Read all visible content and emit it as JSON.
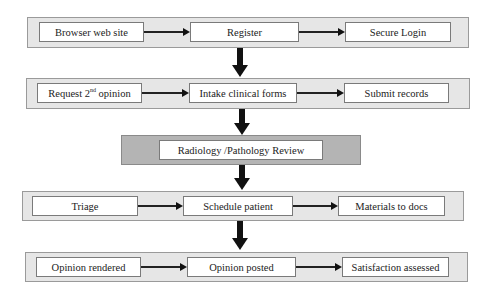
{
  "diagram": {
    "type": "flowchart",
    "rows": [
      {
        "id": "row-1",
        "nodes": [
          {
            "label": "Browser web site"
          },
          {
            "label": "Register"
          },
          {
            "label": "Secure Login"
          }
        ]
      },
      {
        "id": "row-2",
        "nodes": [
          {
            "label_main": "Request 2",
            "label_sup": "nd",
            "label_tail": " opinion"
          },
          {
            "label": "Intake clinical forms"
          },
          {
            "label": "Submit records"
          }
        ]
      },
      {
        "id": "row-3",
        "nodes": [
          {
            "label": "Radiology /Pathology Review"
          }
        ]
      },
      {
        "id": "row-4",
        "nodes": [
          {
            "label": "Triage"
          },
          {
            "label": "Schedule patient"
          },
          {
            "label": "Materials to docs"
          }
        ]
      },
      {
        "id": "row-5",
        "nodes": [
          {
            "label": "Opinion rendered"
          },
          {
            "label": "Opinion posted"
          },
          {
            "label": "Satisfaction assessed"
          }
        ]
      }
    ],
    "colors": {
      "panel": "#e6e6e6",
      "panel_dark": "#b4b4b4",
      "node": "#ffffff",
      "arrow": "#111111"
    }
  }
}
